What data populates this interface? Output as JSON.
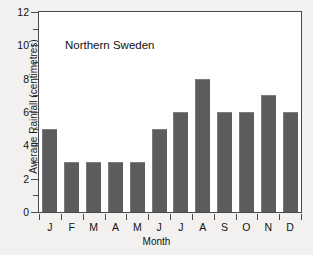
{
  "chart_data": {
    "type": "bar",
    "title": "",
    "annotation": "Northern Sweden",
    "xlabel": "Month",
    "ylabel": "Average Rainfall (centimetres)",
    "categories": [
      "J",
      "F",
      "M",
      "A",
      "M",
      "J",
      "J",
      "A",
      "S",
      "O",
      "N",
      "D"
    ],
    "values": [
      5,
      3,
      3,
      3,
      3,
      5,
      6,
      8,
      6,
      6,
      7,
      6
    ],
    "ylim": [
      0,
      12
    ],
    "ytick_labels": [
      "0",
      "2",
      "4",
      "6",
      "8",
      "10",
      "12"
    ],
    "ytick_values": [
      0,
      2,
      4,
      6,
      8,
      10,
      12
    ],
    "yminor_values": [
      1,
      3,
      5,
      7,
      9,
      11
    ],
    "grid": false,
    "legend": "none",
    "bar_color": "#5c5c5c",
    "plot_background": "#ffffff",
    "page_background": "#f2f1ef",
    "axis_color": "#4a4a4a"
  }
}
